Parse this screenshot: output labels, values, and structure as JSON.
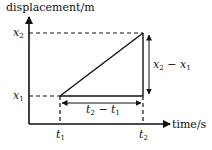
{
  "diagram": {
    "type": "displacement-time graph",
    "y_axis": {
      "label": "displacement/m"
    },
    "x_axis": {
      "label": "time/s"
    },
    "y_ticks": [
      {
        "var": "x",
        "sub": "2"
      },
      {
        "var": "x",
        "sub": "1"
      }
    ],
    "x_ticks": [
      {
        "var": "t",
        "sub": "1"
      },
      {
        "var": "t",
        "sub": "2"
      }
    ],
    "annotations": {
      "delta_x": {
        "a": "x",
        "a_sub": "2",
        "op": " − ",
        "b": "x",
        "b_sub": "1"
      },
      "delta_t": {
        "a": "t",
        "a_sub": "2",
        "op": " − ",
        "b": "t",
        "b_sub": "1"
      }
    },
    "line": {
      "from": [
        "t1",
        "x1"
      ],
      "to": [
        "t2",
        "x2"
      ]
    },
    "colors": {
      "ink": "#111111",
      "background": "#ffffff"
    }
  }
}
